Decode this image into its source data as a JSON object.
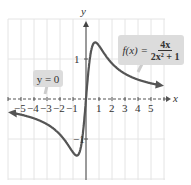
{
  "chart_data": {
    "type": "line",
    "title": "",
    "function": "f(x) = 4x / (2x^2 + 1)",
    "xlabel": "x",
    "ylabel": "y",
    "xlim": [
      -6,
      6
    ],
    "ylim": [
      -2,
      2
    ],
    "x_ticks": [
      "-5",
      "-4",
      "-3",
      "-2",
      "-1",
      "1",
      "2",
      "3",
      "4",
      "5"
    ],
    "y_ticks": [
      "1",
      "-1"
    ],
    "grid": true,
    "series": [
      {
        "name": "f(x) = 4x/(2x^2+1)",
        "x": [
          -5.5,
          -5,
          -4,
          -3,
          -2,
          -1,
          -0.707,
          -0.5,
          0,
          0.5,
          0.707,
          1,
          2,
          3,
          4,
          5
        ],
        "values": [
          -0.36,
          -0.39,
          -0.48,
          -0.63,
          -0.89,
          -1.33,
          -1.41,
          -1.33,
          0,
          1.33,
          1.41,
          1.33,
          0.89,
          0.63,
          0.48,
          0.39
        ]
      }
    ],
    "annotations": [
      {
        "text": "f(x) = 4x / (2x² + 1)",
        "position": "upper right"
      },
      {
        "text": "y = 0",
        "note": "horizontal asymptote",
        "position": "left"
      }
    ]
  },
  "labels": {
    "x_axis": "x",
    "y_axis": "y",
    "one": "1",
    "neg_one": "−1",
    "x_ticks": [
      "−5",
      "−4",
      "−3",
      "−2",
      "−1",
      "1",
      "2",
      "3",
      "4",
      "5"
    ],
    "func_lhs": "f(x) =",
    "func_num": "4x",
    "func_den": "2x² + 1",
    "asymptote": "y = 0"
  }
}
